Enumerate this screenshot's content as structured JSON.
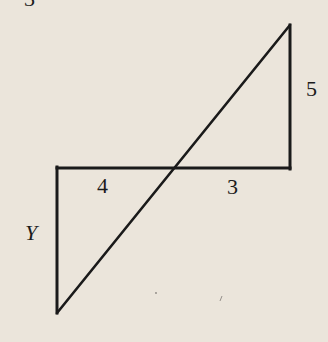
{
  "figure": {
    "type": "geometry-diagram",
    "background_color": "#ebe5db",
    "line_color": "#1a1a1a",
    "top_partial_glyph": "3",
    "labels": {
      "right_vertical": "5",
      "left_horizontal": "4",
      "right_horizontal": "3",
      "left_vertical": "Y"
    },
    "segments": {
      "horizontal": {
        "x1": 57,
        "y1": 168,
        "x2": 290,
        "y2": 168
      },
      "right_vertical": {
        "x1": 290,
        "y1": 25,
        "x2": 290,
        "y2": 168
      },
      "left_vertical": {
        "x1": 57,
        "y1": 168,
        "x2": 57,
        "y2": 313
      },
      "diagonal": {
        "x1": 57,
        "y1": 313,
        "x2": 290,
        "y2": 25
      }
    },
    "known_values": {
      "upper_triangle_vertical_side": 5,
      "upper_triangle_horizontal_side": 3,
      "lower_triangle_horizontal_side": 4,
      "lower_triangle_vertical_side": "Y"
    }
  }
}
